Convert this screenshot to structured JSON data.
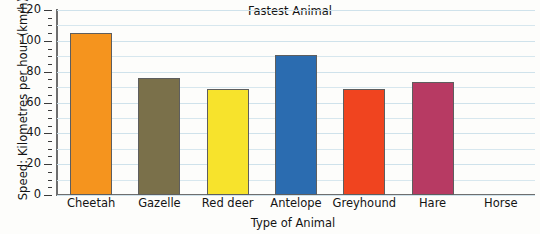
{
  "chart_data": {
    "type": "bar",
    "title": "Fastest Animal",
    "xlabel": "Type of Animal",
    "ylabel": "Speed: Kilometres per hour (km/h)",
    "categories": [
      "Cheetah",
      "Gazelle",
      "Red deer",
      "Antelope",
      "Greyhound",
      "Hare",
      "Horse"
    ],
    "values": [
      105,
      76,
      69,
      91,
      69,
      73,
      null
    ],
    "bar_colors": [
      "#F5941E",
      "#7A704A",
      "#F7E32C",
      "#2B6CB0",
      "#F0441F",
      "#B73A63",
      "#FFFFFF"
    ],
    "ylim": [
      0,
      120
    ],
    "ytick_labels": [
      "0",
      "20",
      "40",
      "60",
      "80",
      "100",
      "120"
    ],
    "ytick_values": [
      0,
      20,
      40,
      60,
      80,
      100,
      120
    ],
    "yminor_step": 5,
    "grid": true,
    "grid_step": 10,
    "legend": null
  }
}
